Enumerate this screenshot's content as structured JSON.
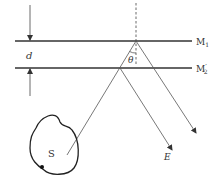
{
  "diagram": {
    "type": "optics-interference",
    "mirrors": {
      "m1_label": "M",
      "m1_sub": "1",
      "m2_label": "M",
      "m2_sub": "2",
      "m2_prime": "′"
    },
    "spacing_label": "d",
    "angle_label": "θ",
    "source_label": "S",
    "eye_label": "E",
    "colors": {
      "line": "#333333",
      "ray": "#555555",
      "background": "#ffffff"
    }
  }
}
